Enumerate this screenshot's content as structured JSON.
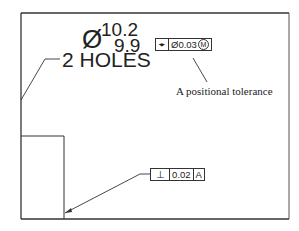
{
  "drawing": {
    "diameter_symbol": "Ø",
    "upper_limit": "10.2",
    "lower_limit": "9.9",
    "note": "2 HOLES",
    "position_fcf": {
      "symbol": "⌖",
      "symbol_name": "position-icon",
      "tolerance": "Ø0.03",
      "modifier": "M",
      "modifier_name": "max-material-condition-icon"
    },
    "perpendicularity_fcf": {
      "symbol": "⊥",
      "symbol_name": "perpendicularity-icon",
      "tolerance": "0.02",
      "datum": "A"
    },
    "caption": "A positional tolerance",
    "colors": {
      "line": "#333333",
      "text": "#222222",
      "background": "#ffffff"
    }
  }
}
